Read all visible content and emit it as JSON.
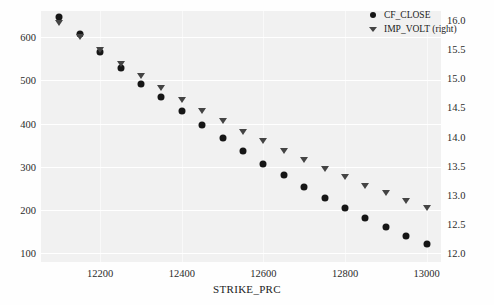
{
  "chart_data": {
    "type": "scatter",
    "title": "",
    "xlabel": "STRIKE_PRC",
    "ylabel": "",
    "xlim": [
      12055,
      13035
    ],
    "ylim": [
      80,
      660
    ],
    "y2lim": [
      11.85,
      16.15
    ],
    "grid": true,
    "legend_position": "top-right",
    "xticks": [
      12200,
      12400,
      12600,
      12800,
      13000
    ],
    "yticks": [
      100,
      200,
      300,
      400,
      500,
      600
    ],
    "y2ticks": [
      "12.0",
      "12.5",
      "13.0",
      "13.5",
      "14.0",
      "14.5",
      "15.0",
      "15.5",
      "16.0"
    ],
    "x": [
      12100,
      12150,
      12200,
      12250,
      12300,
      12350,
      12400,
      12450,
      12500,
      12550,
      12600,
      12650,
      12700,
      12750,
      12800,
      12850,
      12900,
      12950,
      13000
    ],
    "series": [
      {
        "name": "CF_CLOSE",
        "axis": "left",
        "marker": "circle",
        "color": "#161616",
        "values": [
          646,
          606,
          566,
          528,
          492,
          461,
          430,
          397,
          367,
          336,
          307,
          280,
          253,
          228,
          204,
          181,
          160,
          141,
          122
        ]
      },
      {
        "name": "IMP_VOLT (right)",
        "axis": "right",
        "marker": "triangle-down",
        "color": "#444444",
        "values": [
          15.95,
          15.71,
          15.48,
          15.25,
          15.04,
          14.83,
          14.63,
          14.44,
          14.26,
          14.08,
          13.92,
          13.76,
          13.6,
          13.45,
          13.3,
          13.16,
          13.03,
          12.9,
          12.78
        ]
      }
    ]
  },
  "legend": {
    "entries": [
      {
        "label": "CF_CLOSE",
        "marker": "circle"
      },
      {
        "label": "IMP_VOLT (right)",
        "marker": "triangle-down"
      }
    ]
  },
  "colors": {
    "panel_background": "#f1f1f1",
    "gridline": "#ffffff",
    "page_background": "#fefefe",
    "text": "#1c1c1c"
  }
}
